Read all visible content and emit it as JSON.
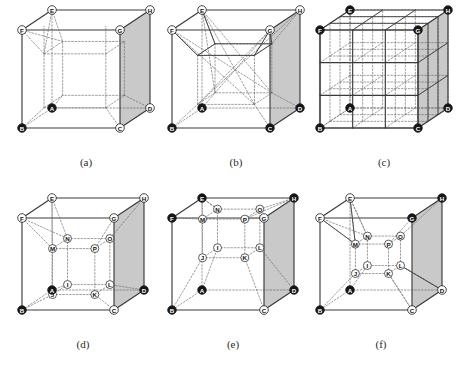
{
  "figure": {
    "panel_count": 6,
    "colors": {
      "line_solid": "#3a3a3a",
      "line_dashed": "#6b6b6b",
      "shaded_face": "#c9c9c9",
      "vertex_filled": "#151515",
      "vertex_open": "#ffffff",
      "caption": "#2b2b2b",
      "background": "#ffffff"
    },
    "captions": [
      "(a)",
      "(b)",
      "(c)",
      "(d)",
      "(e)",
      "(f)"
    ],
    "vertex_labels_outer": [
      "A",
      "B",
      "C",
      "D",
      "E",
      "F",
      "G",
      "H"
    ],
    "vertex_labels_inner": [
      "I",
      "J",
      "K",
      "L",
      "M",
      "N",
      "O",
      "P"
    ]
  },
  "panels": [
    {
      "id": "a",
      "caption": "(a)",
      "description": "Cube with single inscribed inner box, shaded right face",
      "subdivision": "1x1x1 with inner offset box",
      "inner_nodes": [],
      "vertices": [
        {
          "label": "A",
          "fill": "filled"
        },
        {
          "label": "B",
          "fill": "filled"
        },
        {
          "label": "C",
          "fill": "open"
        },
        {
          "label": "D",
          "fill": "open"
        },
        {
          "label": "E",
          "fill": "open"
        },
        {
          "label": "F",
          "fill": "open"
        },
        {
          "label": "G",
          "fill": "open"
        },
        {
          "label": "H",
          "fill": "open"
        }
      ]
    },
    {
      "id": "b",
      "caption": "(b)",
      "description": "Cube with pyramidal diagonals converging to inner box",
      "subdivision": "diagonal pyramid decomposition",
      "inner_nodes": [],
      "vertices": [
        {
          "label": "A",
          "fill": "filled"
        },
        {
          "label": "B",
          "fill": "filled"
        },
        {
          "label": "C",
          "fill": "filled"
        },
        {
          "label": "D",
          "fill": "filled"
        },
        {
          "label": "E",
          "fill": "open"
        },
        {
          "label": "F",
          "fill": "open"
        },
        {
          "label": "G",
          "fill": "open"
        },
        {
          "label": "H",
          "fill": "open"
        }
      ]
    },
    {
      "id": "c",
      "caption": "(c)",
      "description": "Cube uniformly subdivided into a 3x3x3 grid",
      "subdivision": "3x3x3 uniform grid",
      "inner_nodes": [],
      "vertices": [
        {
          "label": "A",
          "fill": "filled"
        },
        {
          "label": "B",
          "fill": "filled"
        },
        {
          "label": "C",
          "fill": "filled"
        },
        {
          "label": "D",
          "fill": "filled"
        },
        {
          "label": "E",
          "fill": "filled"
        },
        {
          "label": "F",
          "fill": "filled"
        },
        {
          "label": "G",
          "fill": "filled"
        },
        {
          "label": "H",
          "fill": "filled"
        }
      ]
    },
    {
      "id": "d",
      "caption": "(d)",
      "description": "Cube with labelled inner box I-P, A, B, D filled",
      "subdivision": "inner hexahedron I J K L M N O P",
      "inner_nodes": [
        "I",
        "J",
        "K",
        "L",
        "M",
        "N",
        "O",
        "P"
      ],
      "vertices": [
        {
          "label": "A",
          "fill": "filled"
        },
        {
          "label": "B",
          "fill": "filled"
        },
        {
          "label": "C",
          "fill": "open"
        },
        {
          "label": "D",
          "fill": "filled"
        },
        {
          "label": "E",
          "fill": "open"
        },
        {
          "label": "F",
          "fill": "open"
        },
        {
          "label": "G",
          "fill": "open"
        },
        {
          "label": "H",
          "fill": "open"
        }
      ]
    },
    {
      "id": "e",
      "caption": "(e)",
      "description": "Cube with inner box raised toward top face, E, F, H, A, B, D filled",
      "subdivision": "inner hexahedron I J K L M N O P raised",
      "inner_nodes": [
        "I",
        "J",
        "K",
        "L",
        "M",
        "N",
        "O",
        "P"
      ],
      "vertices": [
        {
          "label": "A",
          "fill": "filled"
        },
        {
          "label": "B",
          "fill": "filled"
        },
        {
          "label": "C",
          "fill": "open"
        },
        {
          "label": "D",
          "fill": "filled"
        },
        {
          "label": "E",
          "fill": "filled"
        },
        {
          "label": "F",
          "fill": "filled"
        },
        {
          "label": "G",
          "fill": "open"
        },
        {
          "label": "H",
          "fill": "filled"
        }
      ]
    },
    {
      "id": "f",
      "caption": "(f)",
      "description": "Cube with small inner box, A, B, G, H filled",
      "subdivision": "inner hexahedron I J K L M N O P compact",
      "inner_nodes": [
        "I",
        "J",
        "K",
        "L",
        "M",
        "N",
        "O",
        "P"
      ],
      "vertices": [
        {
          "label": "A",
          "fill": "filled"
        },
        {
          "label": "B",
          "fill": "filled"
        },
        {
          "label": "C",
          "fill": "open"
        },
        {
          "label": "D",
          "fill": "open"
        },
        {
          "label": "E",
          "fill": "open"
        },
        {
          "label": "F",
          "fill": "open"
        },
        {
          "label": "G",
          "fill": "filled"
        },
        {
          "label": "H",
          "fill": "filled"
        }
      ]
    }
  ]
}
